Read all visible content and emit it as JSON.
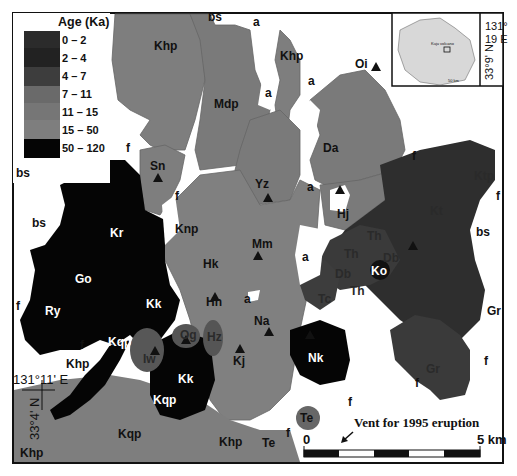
{
  "legend": {
    "title": "Age (Ka)",
    "items": [
      {
        "label": "0 – 2",
        "color": "#2b2b2b"
      },
      {
        "label": "2 – 4",
        "color": "#222222"
      },
      {
        "label": "4 – 7",
        "color": "#3d3d3d"
      },
      {
        "label": "7 – 11",
        "color": "#6a6a6a"
      },
      {
        "label": "11 – 15",
        "color": "#767676"
      },
      {
        "label": "15 – 50",
        "color": "#7e7e7e"
      },
      {
        "label": "50 – 120",
        "color": "#050505"
      }
    ]
  },
  "units": {
    "Khp_n": "Khp",
    "Mdp": "Mdp",
    "Khp_ne": "Khp",
    "Oi": "Oi",
    "Da": "Da",
    "Sn": "Sn",
    "Yz": "Yz",
    "Kr": "Kr",
    "Knp": "Knp",
    "Hj": "Hj",
    "Kt": "Kt",
    "Ktp": "Ktp",
    "Go": "Go",
    "Hk": "Hk",
    "Mm": "Mm",
    "Th1": "Th",
    "Th2": "Th",
    "Th3": "Th",
    "Db1": "Db",
    "Db2": "Db",
    "Ko": "Ko",
    "Ry": "Ry",
    "Kk1": "Kk",
    "Kk2": "Kk",
    "Hn": "Hn",
    "Tc": "Tc",
    "Na": "Na",
    "Kqp1": "Kqp",
    "Kqp2": "Kqp",
    "Kqp3": "Kqp",
    "Og": "Og",
    "Iw": "Iw",
    "Hz": "Hz",
    "Kj": "Kj",
    "Nk": "Nk",
    "Gr1": "Gr",
    "Gr2": "Gr",
    "Te1": "Te",
    "Te2": "Te",
    "Khp_sw": "Khp",
    "Khp_s": "Khp",
    "Khp_w": "Khp"
  },
  "deposits": {
    "bs": "bs",
    "a": "a",
    "f": "f"
  },
  "coords": {
    "sw_lon": "131°11' E",
    "sw_lat": "33°4' N",
    "ne_lon_1": "131°",
    "ne_lon_2": "19 E",
    "ne_lat": "33°9' N"
  },
  "inset": {
    "label": "Kuju volcano",
    "scale": "50 km"
  },
  "annotation": {
    "vent": "Vent for 1995 eruption"
  },
  "scale_bar": {
    "start": "0",
    "end": "5 km"
  }
}
